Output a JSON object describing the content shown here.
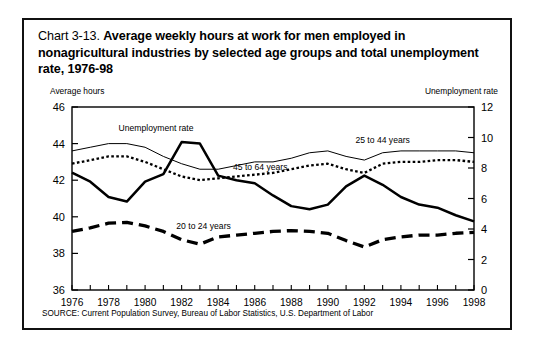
{
  "title": {
    "number": "Chart 3-13.",
    "text": "Average weekly hours at work for men employed in nonagricultural industries by selected age groups and total unemployment  rate, 1976-98"
  },
  "axis_label_left": "Average hours",
  "axis_label_right": "Unemployment rate",
  "source": "SOURCE: Current Population Survey, Bureau of Labor Statistics, U.S. Department of Labor",
  "chart_data": {
    "type": "line",
    "title": "Chart 3-13. Average weekly hours at work for men employed in nonagricultural industries by selected age groups and total unemployment  rate, 1976-98",
    "xlabel": "",
    "ylabel": "Average hours",
    "ylabel_right": "Unemployment rate",
    "xlim": [
      1976,
      1998
    ],
    "ylim": [
      36,
      46
    ],
    "ylim_right": [
      0,
      12
    ],
    "yticks": [
      36,
      38,
      40,
      42,
      44,
      46
    ],
    "yticks_right": [
      0,
      2,
      4,
      6,
      8,
      10,
      12
    ],
    "xticks": [
      1976,
      1978,
      1980,
      1982,
      1984,
      1986,
      1988,
      1990,
      1992,
      1994,
      1996,
      1998
    ],
    "grid": false,
    "legend_position": "inline-annotations",
    "x": [
      1976,
      1977,
      1978,
      1979,
      1980,
      1981,
      1982,
      1983,
      1984,
      1985,
      1986,
      1987,
      1988,
      1989,
      1990,
      1991,
      1992,
      1993,
      1994,
      1995,
      1996,
      1997,
      1998
    ],
    "series": [
      {
        "name": "25 to 44 years",
        "axis": "left",
        "style": "thin-solid",
        "label_x": 1993,
        "label_y": 44.05,
        "values": [
          43.6,
          43.8,
          44.0,
          44.0,
          43.8,
          43.3,
          42.9,
          42.6,
          42.6,
          42.8,
          43.0,
          43.0,
          43.2,
          43.5,
          43.6,
          43.3,
          43.1,
          43.5,
          43.6,
          43.6,
          43.6,
          43.6,
          43.5
        ]
      },
      {
        "name": "45 to 64 years",
        "axis": "left",
        "style": "dotted",
        "label_x": 1986.3,
        "label_y": 42.55,
        "values": [
          42.9,
          43.1,
          43.3,
          43.3,
          43.0,
          42.6,
          42.2,
          42.0,
          42.1,
          42.2,
          42.3,
          42.4,
          42.6,
          42.8,
          42.9,
          42.6,
          42.4,
          42.9,
          43.0,
          43.0,
          43.1,
          43.1,
          43.0
        ]
      },
      {
        "name": "20 to 24 years",
        "axis": "left",
        "style": "dashed-thick",
        "label_x": 1983.2,
        "label_y": 39.35,
        "values": [
          39.2,
          39.4,
          39.65,
          39.7,
          39.5,
          39.2,
          38.75,
          38.5,
          38.9,
          39.0,
          39.1,
          39.2,
          39.25,
          39.2,
          39.1,
          38.7,
          38.35,
          38.75,
          38.9,
          39.0,
          39.0,
          39.1,
          39.15
        ]
      },
      {
        "name": "Unemployment rate",
        "axis": "right",
        "style": "thick-solid",
        "label_x": 1980.6,
        "label_y_right": 10.45,
        "values": [
          7.7,
          7.1,
          6.1,
          5.8,
          7.1,
          7.6,
          9.7,
          9.6,
          7.5,
          7.2,
          7.0,
          6.2,
          5.5,
          5.3,
          5.6,
          6.8,
          7.5,
          6.9,
          6.1,
          5.6,
          5.4,
          4.9,
          4.5
        ]
      }
    ]
  }
}
